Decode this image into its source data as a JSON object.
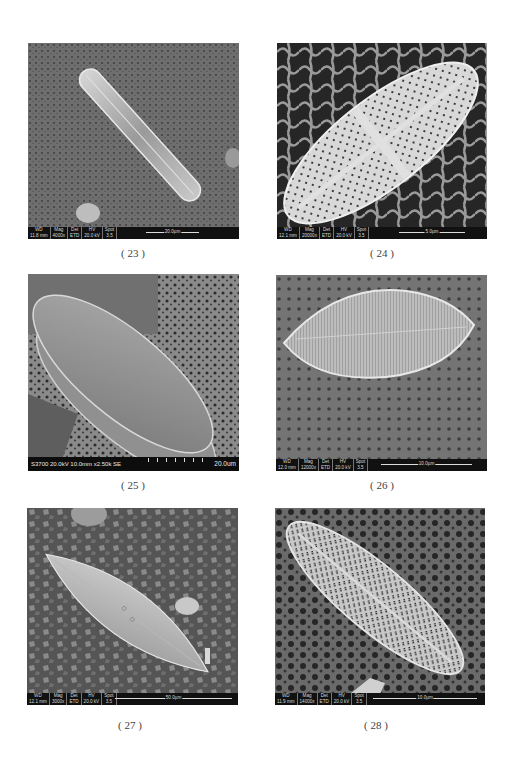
{
  "figures": [
    {
      "caption": "( 23 )",
      "databar": {
        "wd": "11.8 mm",
        "mag": "4000x",
        "det": "ETD",
        "hv": "20.0 kV",
        "spot": "3.5"
      },
      "scale_bar": "20.0µm",
      "style": "fei"
    },
    {
      "caption": "( 24 )",
      "databar": {
        "wd": "12.1 mm",
        "mag": "20000x",
        "det": "ETD",
        "hv": "20.0 kV",
        "spot": "3.5"
      },
      "scale_bar": "5.0µm",
      "style": "fei"
    },
    {
      "caption": "( 25 )",
      "info_line": "S3700 20.0kV 10.0mm x2.50k SE",
      "scale_bar": "20.0um",
      "style": "hitachi"
    },
    {
      "caption": "( 26 )",
      "databar": {
        "wd": "12.0 mm",
        "mag": "12000x",
        "det": "ETD",
        "hv": "20.0 kV",
        "spot": "3.5"
      },
      "scale_bar": "10.0µm",
      "style": "fei"
    },
    {
      "caption": "( 27 )",
      "databar": {
        "wd": "12.1 mm",
        "mag": "3000x",
        "det": "ETD",
        "hv": "20.0 kV",
        "spot": "3.5"
      },
      "scale_bar": "50.0µm",
      "style": "fei"
    },
    {
      "caption": "( 28 )",
      "databar": {
        "wd": "11.9 mm",
        "mag": "14000x",
        "det": "ETD",
        "hv": "20.0 kV",
        "spot": "3.5"
      },
      "scale_bar": "10.0µm",
      "style": "fei"
    }
  ],
  "databar_headers": {
    "wd": "WD",
    "mag": "Mag",
    "det": "Det",
    "hv": "HV",
    "spot": "Spot"
  }
}
